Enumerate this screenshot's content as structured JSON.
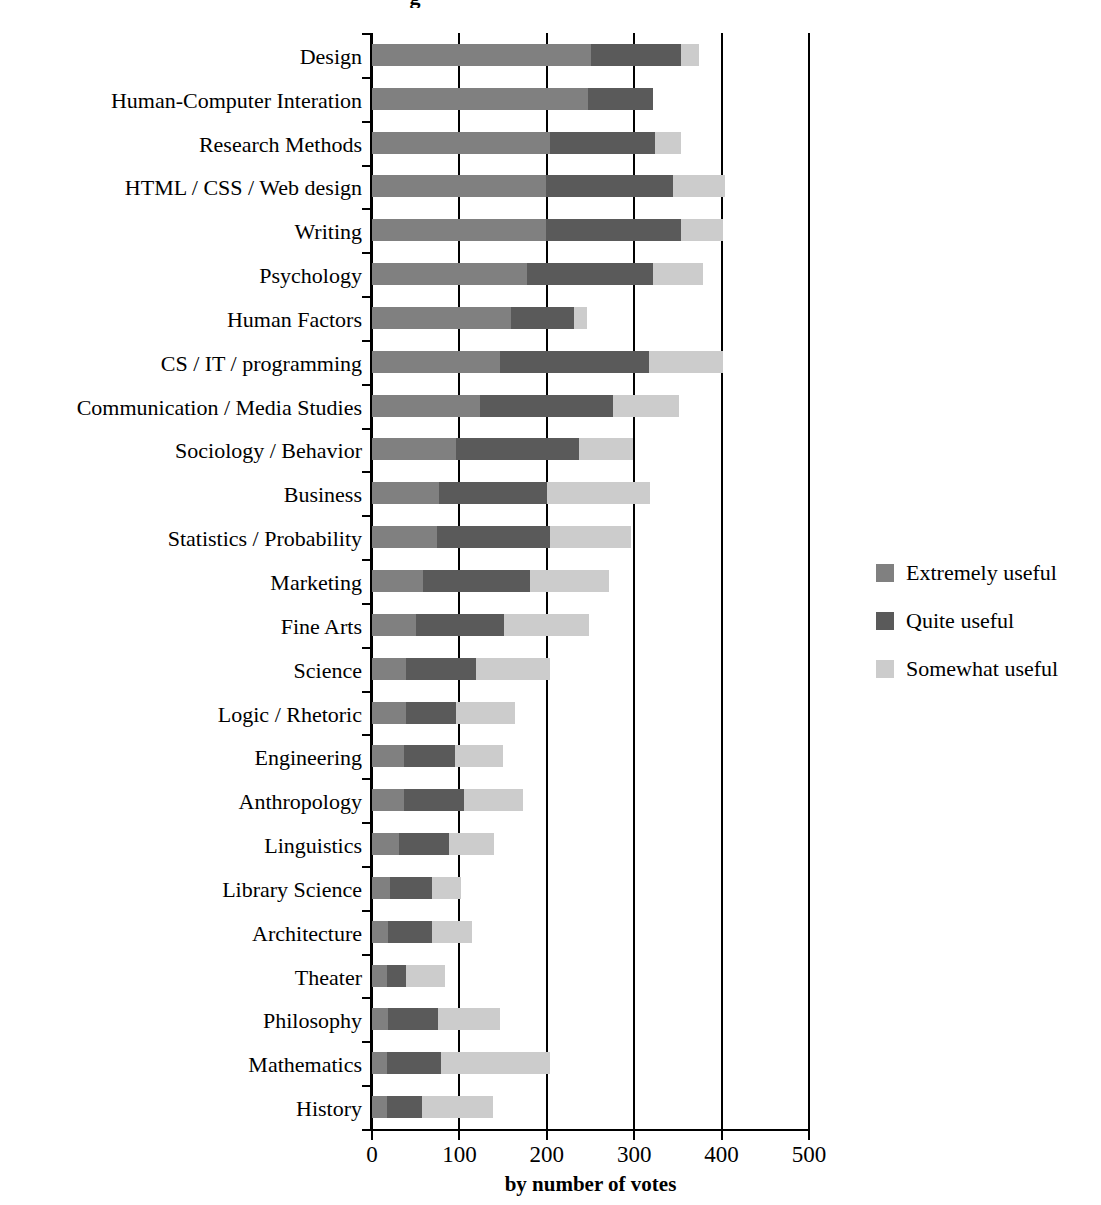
{
  "chart_data": {
    "type": "bar",
    "subtype": "stacked-horizontal-bar",
    "title": "g",
    "xlabel": "by number of votes",
    "ylabel": "",
    "xlim": [
      0,
      500
    ],
    "xticks": [
      0,
      100,
      200,
      300,
      400,
      500
    ],
    "xtick_labels": [
      "0",
      "100",
      "200",
      "300",
      "400",
      "500"
    ],
    "grid": true,
    "grid_axis": "x",
    "legend_position": "right",
    "categories": [
      "Design",
      "Human-Computer Interation",
      "Research Methods",
      "HTML / CSS / Web design",
      "Writing",
      "Psychology",
      "Human Factors",
      "CS / IT / programming",
      "Communication / Media Studies",
      "Sociology / Behavior",
      "Business",
      "Statistics / Probability",
      "Marketing",
      "Fine Arts",
      "Science",
      "Logic / Rhetoric",
      "Engineering",
      "Anthropology",
      "Linguistics",
      "Library Science",
      "Architecture",
      "Theater",
      "Philosophy",
      "Mathematics",
      "History"
    ],
    "series": [
      {
        "name": "Extremely useful",
        "color": "#808080",
        "values": [
          252,
          248,
          205,
          200,
          200,
          178,
          160,
          148,
          125,
          97,
          78,
          75,
          60,
          52,
          40,
          40,
          38,
          38,
          32,
          22,
          20,
          18,
          20,
          18,
          18
        ]
      },
      {
        "name": "Quite useful",
        "color": "#5a5a5a",
        "values": [
          103,
          75,
          120,
          145,
          155,
          145,
          72,
          170,
          152,
          141,
          123,
          130,
          122,
          100,
          80,
          57,
          58,
          68,
          57,
          48,
          50,
          22,
          57,
          62,
          40
        ]
      },
      {
        "name": "Somewhat useful",
        "color": "#cccccc",
        "values": [
          20,
          0,
          30,
          60,
          48,
          57,
          15,
          85,
          75,
          62,
          118,
          92,
          90,
          98,
          85,
          68,
          55,
          68,
          52,
          33,
          45,
          45,
          71,
          125,
          82
        ]
      }
    ],
    "totals": [
      375,
      323,
      355,
      405,
      403,
      380,
      247,
      403,
      352,
      300,
      319,
      297,
      272,
      250,
      205,
      165,
      151,
      174,
      141,
      103,
      115,
      85,
      148,
      205,
      140
    ]
  },
  "legend": {
    "items": [
      {
        "label": "Extremely useful",
        "color": "#808080"
      },
      {
        "label": "Quite useful",
        "color": "#5a5a5a"
      },
      {
        "label": "Somewhat useful",
        "color": "#cccccc"
      }
    ]
  }
}
